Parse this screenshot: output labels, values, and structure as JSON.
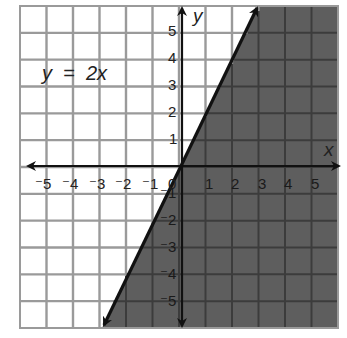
{
  "chart_data": {
    "type": "line",
    "title": "",
    "equation_label": "y  =  2x",
    "xlabel": "x",
    "ylabel": "y",
    "xlim": [
      -6,
      6
    ],
    "ylim": [
      -6,
      6
    ],
    "grid": true,
    "x_ticks": [
      "-5",
      "-4",
      "-3",
      "-2",
      "-1",
      "0",
      "1",
      "2",
      "3",
      "4",
      "5"
    ],
    "y_ticks": [
      "5",
      "4",
      "3",
      "2",
      "1",
      "-1",
      "-2",
      "-3",
      "-4",
      "-5"
    ],
    "series": [
      {
        "name": "y = 2x",
        "slope": 2,
        "intercept": 0,
        "x": [
          -3,
          3
        ],
        "y": [
          -6,
          6
        ],
        "arrows": "both"
      }
    ],
    "shaded_region": {
      "description": "right of / below the line y = 2x",
      "inequality": "y < 2x",
      "color": "#5e5e5e"
    }
  },
  "labels": {
    "equation": "y  =  2x",
    "x_axis": "x",
    "y_axis": "y",
    "origin": "0",
    "x_neg": [
      "⁻5",
      "⁻4",
      "⁻3",
      "⁻2",
      "⁻1"
    ],
    "x_pos": [
      "1",
      "2",
      "3",
      "4",
      "5"
    ],
    "y_pos": [
      "5",
      "4",
      "3",
      "2",
      "1"
    ],
    "y_neg": [
      "⁻1",
      "⁻2",
      "⁻3",
      "⁻4",
      "⁻5"
    ]
  },
  "colors": {
    "shade": "#5e5e5e",
    "grid_light": "#9a9a9a",
    "grid_dark": "#3c3c3c",
    "line": "#111111"
  }
}
